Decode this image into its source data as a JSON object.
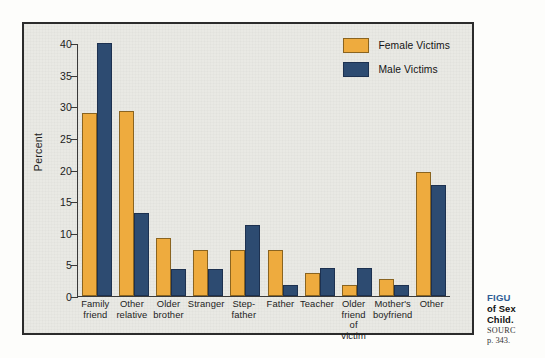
{
  "chart_data": {
    "type": "bar",
    "title": "",
    "xlabel": "",
    "ylabel": "Percent",
    "ylim": [
      0,
      40
    ],
    "yticks": [
      0,
      5,
      10,
      15,
      20,
      25,
      30,
      35,
      40
    ],
    "grid": false,
    "legend_position": "top-right",
    "categories": [
      "Family friend",
      "Other relative",
      "Older brother",
      "Stranger",
      "Step-father",
      "Father",
      "Teacher",
      "Older friend of victim",
      "Mother's boyfriend",
      "Other"
    ],
    "category_lines": [
      [
        "Family",
        "friend"
      ],
      [
        "Other",
        "relative"
      ],
      [
        "Older",
        "brother"
      ],
      [
        "Stranger"
      ],
      [
        "Step-",
        "father"
      ],
      [
        "Father"
      ],
      [
        "Teacher"
      ],
      [
        "Older",
        "friend",
        "of victim"
      ],
      [
        "Mother's",
        "boyfriend"
      ],
      [
        "Other"
      ]
    ],
    "series": [
      {
        "name": "Female Victims",
        "color": "#eeab3e",
        "values": [
          29.0,
          29.2,
          9.2,
          7.2,
          7.2,
          7.3,
          3.7,
          1.7,
          2.7,
          19.6
        ]
      },
      {
        "name": "Male Victims",
        "color": "#2d4b71",
        "values": [
          40.0,
          13.2,
          4.3,
          4.3,
          11.3,
          1.7,
          4.4,
          4.5,
          1.7,
          17.6
        ]
      }
    ]
  },
  "legend": {
    "items": [
      {
        "label": "Female Victims",
        "swatch": "female-swatch"
      },
      {
        "label": "Male Victims",
        "swatch": "male-swatch"
      }
    ]
  },
  "caption": {
    "figure_label": "FIGU",
    "line1": "of Sex",
    "line2": "Child.",
    "source_label": "SOURC",
    "page": "p. 343."
  },
  "colors": {
    "female": "#eeab3e",
    "male": "#2d4b71",
    "panel_background": "#e9e9e4",
    "frame_border": "#2b2b2b",
    "caption_accent": "#2f5d96"
  }
}
